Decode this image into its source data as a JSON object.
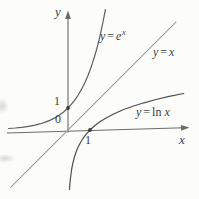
{
  "figure": {
    "axis_x_label": "x",
    "axis_y_label": "y",
    "origin_label": "0",
    "unit_y_label": "1",
    "unit_x_label": "1"
  },
  "equations": {
    "exp": {
      "lhs": "y",
      "eq": "=",
      "base": "e",
      "sup": "x"
    },
    "identity": {
      "lhs": "y",
      "eq": "=",
      "rhs": "x"
    },
    "log": {
      "lhs": "y",
      "eq": "=",
      "fn": "ln",
      "arg": "x"
    }
  },
  "colors": {
    "background": "#fcfcfb",
    "axis": "#6a6a6a",
    "text": "#3c3c3c",
    "exp_curve": "#5c5c5c",
    "identity_line": "#9b9b9b",
    "log_curve": "#4f4f4f",
    "point_dot": "#3d3d3d"
  },
  "chart_data": {
    "type": "line",
    "title": "",
    "xlabel": "x",
    "ylabel": "y",
    "grid": false,
    "legend": "inline-curve-labels",
    "xlim": [
      -2.8,
      5.5
    ],
    "ylim": [
      -3.2,
      5.2
    ],
    "axis_tick_labels": {
      "x": [
        0,
        1
      ],
      "y": [
        1
      ]
    },
    "marked_points": [
      {
        "x": 0,
        "y": 1
      },
      {
        "x": 1,
        "y": 0
      }
    ],
    "transform": {
      "origin_px": [
        68,
        130
      ],
      "unit_px": 22
    },
    "series": [
      {
        "name": "y = e^x",
        "expression": "exp(x)",
        "color": "#5c5c5c",
        "x": [
          -2.7,
          -2.4,
          -2.1,
          -1.8,
          -1.5,
          -1.25,
          -1.0,
          -0.8,
          -0.6,
          -0.4,
          -0.2,
          0,
          0.15,
          0.3,
          0.45,
          0.6,
          0.75,
          0.9,
          1.0,
          1.1,
          1.2,
          1.3,
          1.4,
          1.5,
          1.6,
          1.7
        ],
        "y": [
          0.067,
          0.091,
          0.122,
          0.165,
          0.223,
          0.287,
          0.368,
          0.449,
          0.549,
          0.67,
          0.819,
          1.0,
          1.162,
          1.35,
          1.568,
          1.822,
          2.117,
          2.46,
          2.718,
          3.004,
          3.32,
          3.669,
          4.055,
          4.482,
          4.953,
          5.474
        ]
      },
      {
        "name": "y = x",
        "expression": "x",
        "color": "#9b9b9b",
        "x": [
          -2.62,
          4.92
        ],
        "y": [
          -2.62,
          4.92
        ]
      },
      {
        "name": "y = ln x",
        "expression": "ln(x)",
        "color": "#4f4f4f",
        "x": [
          0.067,
          0.091,
          0.122,
          0.165,
          0.223,
          0.287,
          0.368,
          0.449,
          0.549,
          0.67,
          0.819,
          1.0,
          1.2,
          1.45,
          1.75,
          2.1,
          2.5,
          2.95,
          3.45,
          4.0,
          4.6,
          5.26
        ],
        "y": [
          -2.7,
          -2.4,
          -2.1,
          -1.8,
          -1.5,
          -1.25,
          -1.0,
          -0.8,
          -0.6,
          -0.4,
          -0.2,
          0,
          0.182,
          0.372,
          0.56,
          0.742,
          0.916,
          1.082,
          1.238,
          1.386,
          1.526,
          1.66
        ]
      }
    ]
  }
}
